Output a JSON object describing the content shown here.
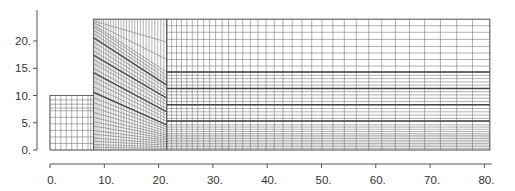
{
  "chart_data": {
    "type": "mesh",
    "title": "",
    "xlabel": "",
    "ylabel": "",
    "xlim": [
      0,
      81
    ],
    "ylim": [
      0,
      24
    ],
    "grid": false,
    "x_ticks": [
      0,
      10,
      20,
      30,
      40,
      50,
      60,
      70,
      80
    ],
    "x_tick_labels": [
      "0.",
      "10.",
      "20.",
      "30.",
      "40.",
      "50.",
      "60.",
      "70.",
      "80."
    ],
    "y_ticks": [
      0,
      5,
      10,
      15,
      20
    ],
    "y_tick_labels": [
      "0.",
      "5.",
      "10.",
      "15.",
      "20."
    ],
    "line_color": "#6e6e6e",
    "thick_line_color": "#444444",
    "regions": [
      {
        "name": "left-block",
        "x_range": [
          0,
          8
        ],
        "y_range": [
          0,
          10
        ],
        "x_lines": [
          0,
          1,
          2,
          3,
          4,
          5,
          6,
          7,
          7.5,
          8
        ],
        "y_lines": [
          0,
          1.2,
          2.4,
          3.6,
          4.8,
          6.0,
          7.2,
          7.7,
          8.4,
          9.2,
          10
        ]
      },
      {
        "name": "wedge",
        "x_range": [
          8,
          21.5
        ],
        "top": 24,
        "n_vertical": 28,
        "left_y_lines": [
          0,
          0.5,
          1.0,
          1.6,
          2.2,
          2.9,
          3.6,
          4.4,
          5.2,
          6.0,
          6.9,
          7.8,
          8.7,
          9.6,
          10.6,
          11.6,
          12.6,
          13.4,
          14.2,
          15.0,
          15.9,
          16.6,
          17.4,
          18.2,
          19.0,
          19.8,
          20.6,
          21.4,
          22.0,
          22.6,
          23.0,
          23.4,
          23.7,
          24
        ],
        "right_y_lines": [
          0,
          0.3,
          0.6,
          0.9,
          1.2,
          1.5,
          1.8,
          2.1,
          2.4,
          2.7,
          3.0,
          3.4,
          3.8,
          4.2,
          4.6,
          5.3,
          5.8,
          6.4,
          7.0,
          7.6,
          8.3,
          8.9,
          9.5,
          10.1,
          10.7,
          11.3,
          11.9,
          12.5,
          13.1,
          13.7,
          14.3,
          16.6,
          19.8,
          24
        ],
        "thick_indices": [
          14,
          18,
          22,
          26
        ]
      },
      {
        "name": "right-block",
        "x_range": [
          21.5,
          81
        ],
        "y_range": [
          0,
          24
        ],
        "x_lines": [
          21.5,
          22.4,
          23.3,
          24.2,
          25.2,
          26.2,
          27.2,
          28.3,
          29.4,
          30.5,
          31.7,
          32.9,
          34.2,
          35.5,
          36.9,
          38.3,
          39.8,
          41.3,
          42.9,
          44.6,
          46.4,
          48.2,
          50.1,
          52.1,
          54.2,
          56.4,
          58.7,
          61.1,
          63.6,
          66.2,
          69.0,
          71.9,
          74.9,
          77.8,
          81
        ],
        "y_lines": [
          0,
          0.3,
          0.6,
          0.9,
          1.2,
          1.5,
          1.8,
          2.1,
          2.4,
          2.7,
          3.0,
          3.4,
          3.8,
          4.2,
          4.6,
          5.3,
          5.8,
          6.4,
          7.0,
          7.6,
          8.3,
          8.9,
          9.5,
          10.1,
          10.7,
          11.3,
          11.9,
          12.5,
          13.1,
          13.7,
          14.3,
          15.4,
          16.6,
          17.8,
          19.0,
          20.3,
          21.6,
          22.8,
          24
        ],
        "thick_y": [
          5.3,
          8.3,
          11.3,
          14.3
        ]
      }
    ]
  },
  "layout": {
    "origin_px": [
      50,
      150
    ],
    "px_per_unit_x": 5.43,
    "px_per_unit_y": 5.45,
    "y_axis_x_px": 37,
    "y_axis_top_px": 10,
    "x_axis_y_px": 164
  }
}
